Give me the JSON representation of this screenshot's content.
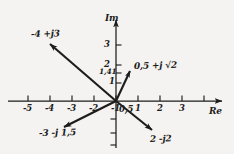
{
  "figure": {
    "kind": "complex-plane-argand-diagram",
    "background_color": "#f4f3f1",
    "ink_color": "#1d1c1b"
  },
  "axes": {
    "real": {
      "label": "Re",
      "arrow": "right",
      "ticks": [
        "-5",
        "-4",
        "-3",
        "-2",
        "-1",
        "0,5",
        "1",
        "2",
        "3"
      ]
    },
    "imag": {
      "label": "Im",
      "arrow": "up",
      "ticks": [
        "3",
        "2",
        "1,41",
        "1"
      ]
    }
  },
  "tick_labels": {
    "re_m5": "-5",
    "re_m4": "-4",
    "re_m3": "-3",
    "re_m2": "-2",
    "re_m1": "-1",
    "re_0p5": "0,5",
    "re_1": "1",
    "re_2": "2",
    "re_3": "3",
    "im_3": "3",
    "im_2": "2",
    "im_1p41": "1,41",
    "im_1": "1"
  },
  "vectors": [
    {
      "id": "vector-minus4-plus-j3",
      "label": "-4 +j3",
      "re": -4,
      "im": 3,
      "direction": "upper-left"
    },
    {
      "id": "vector-0p5-plus-j-sqrt2",
      "label": "0,5 +j √2",
      "re": 0.5,
      "im": 1.41,
      "direction": "upper-right"
    },
    {
      "id": "vector-minus3-minus-j1p5",
      "label": "-3 -j 1,5",
      "re": -3,
      "im": -1.5,
      "direction": "lower-left"
    },
    {
      "id": "vector-2-minus-j2",
      "label": "2 -j2",
      "re": 2,
      "im": -2,
      "direction": "lower-right"
    }
  ]
}
